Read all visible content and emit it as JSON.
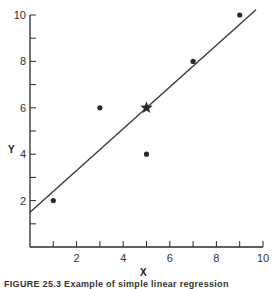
{
  "chart_data": {
    "type": "scatter",
    "title": "",
    "xlabel": "X",
    "ylabel": "Y",
    "xlim": [
      0,
      10
    ],
    "ylim": [
      0,
      10
    ],
    "grid": false,
    "x_ticks": [
      2,
      4,
      6,
      8,
      10
    ],
    "y_ticks": [
      2,
      4,
      6,
      8,
      10
    ],
    "x_minor_ticks": [
      1,
      3,
      5,
      7,
      9
    ],
    "y_minor_ticks": [
      1,
      3,
      5,
      7,
      9
    ],
    "series": [
      {
        "name": "data points",
        "marker": "circle",
        "points": [
          {
            "x": 1,
            "y": 2
          },
          {
            "x": 3,
            "y": 6
          },
          {
            "x": 5,
            "y": 4
          },
          {
            "x": 7,
            "y": 8
          },
          {
            "x": 9,
            "y": 10
          }
        ]
      },
      {
        "name": "mean point",
        "marker": "star",
        "points": [
          {
            "x": 5,
            "y": 6
          }
        ]
      }
    ],
    "regression_line": {
      "slope": 0.9,
      "intercept": 1.5,
      "x_start": 0,
      "x_end": 9.7
    }
  },
  "caption": "FIGURE 25.3  Example of simple linear regression"
}
